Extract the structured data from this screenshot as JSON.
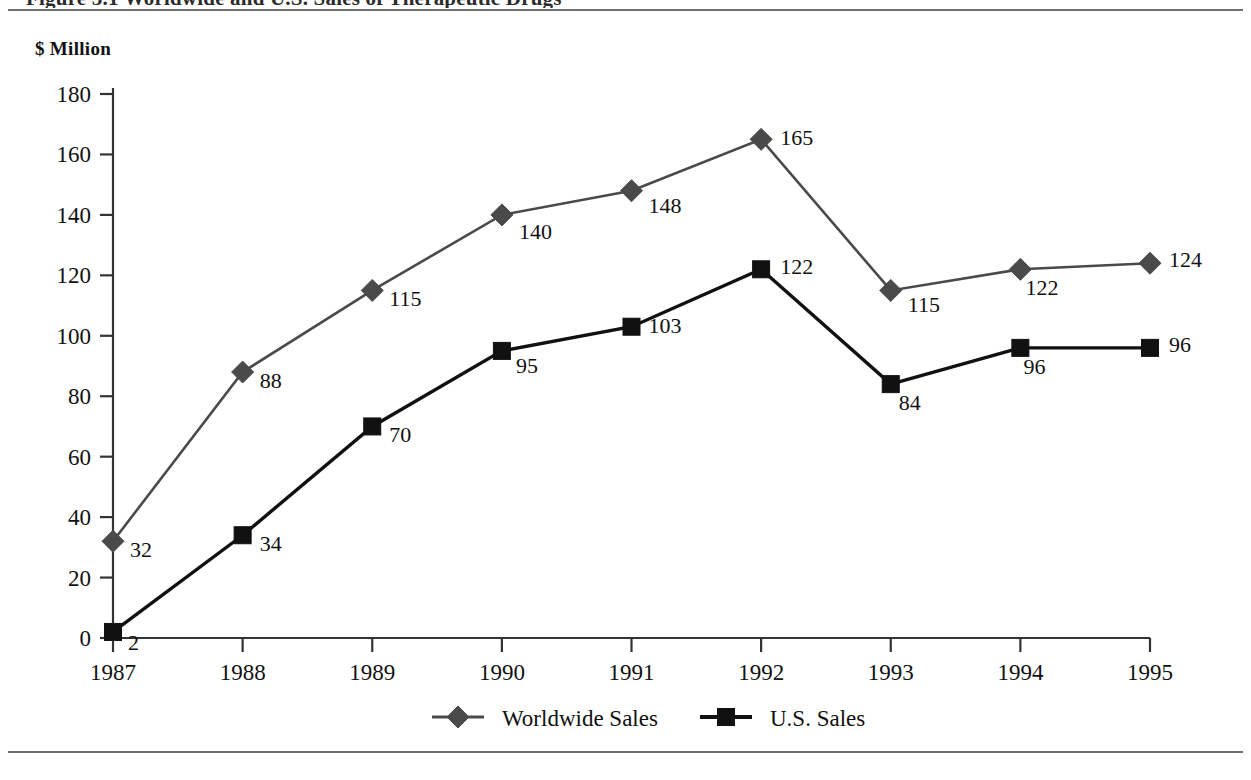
{
  "document": {
    "title_fragment": "Figure 3.1  Worldwide and U.S. Sales of Therapeutic Drugs",
    "unit_label": "$ Million"
  },
  "chart_data": {
    "type": "line",
    "title": "",
    "xlabel": "",
    "ylabel": "$ Million",
    "ylim": [
      0,
      180
    ],
    "ytick_step": 20,
    "grid": false,
    "legend_position": "bottom-center",
    "categories": [
      "1987",
      "1988",
      "1989",
      "1990",
      "1991",
      "1992",
      "1993",
      "1994",
      "1995"
    ],
    "yticks": [
      "0",
      "20",
      "40",
      "60",
      "80",
      "100",
      "120",
      "140",
      "160",
      "180"
    ],
    "series": [
      {
        "name": "Worldwide Sales",
        "marker": "diamond",
        "color": "#4a4a4a",
        "values": [
          32,
          88,
          115,
          140,
          148,
          165,
          115,
          122,
          124
        ],
        "labels": [
          "32",
          "88",
          "115",
          "140",
          "148",
          "165",
          "115",
          "122",
          "124"
        ]
      },
      {
        "name": "U.S. Sales",
        "marker": "square",
        "color": "#111111",
        "values": [
          2,
          34,
          70,
          95,
          103,
          122,
          84,
          96,
          96
        ],
        "labels": [
          "2",
          "34",
          "70",
          "95",
          "103",
          "122",
          "84",
          "96",
          "96"
        ]
      }
    ]
  },
  "legend": {
    "items": [
      {
        "label": "Worldwide Sales",
        "marker": "diamond",
        "color": "#4a4a4a"
      },
      {
        "label": "U.S. Sales",
        "marker": "square",
        "color": "#111111"
      }
    ]
  }
}
